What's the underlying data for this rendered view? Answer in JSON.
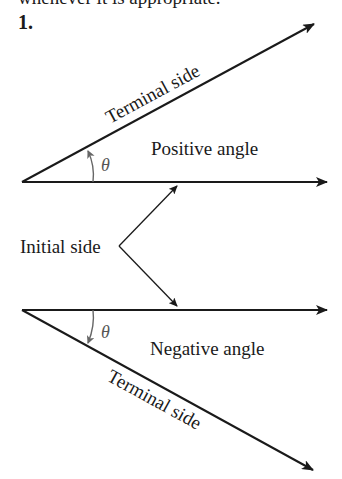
{
  "header": {
    "cut_text": "whenever it is appropriate.",
    "exercise_number": "1."
  },
  "diagram": {
    "positive": {
      "terminal_label": "Terminal side",
      "angle_label": "Positive angle",
      "theta": "θ"
    },
    "negative": {
      "terminal_label": "Terminal side",
      "angle_label": "Negative angle",
      "theta": "θ"
    },
    "initial_label": "Initial side"
  },
  "colors": {
    "line": "#1a1a1a",
    "arc": "#666666",
    "background": "#ffffff"
  }
}
